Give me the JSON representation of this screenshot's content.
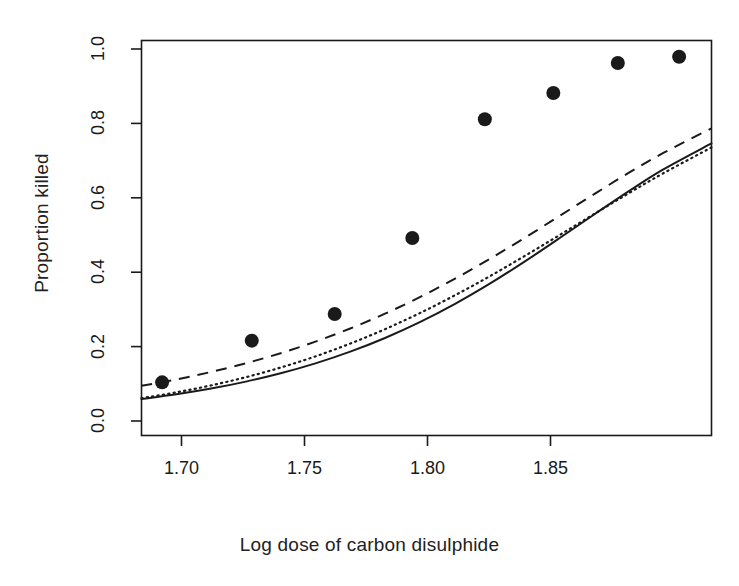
{
  "figure": {
    "title": "",
    "background_color": "#ffffff",
    "ink_color": "#1a1a1a"
  },
  "axes": {
    "x_label": "Log dose of carbon disulphide",
    "y_label": "Proportion killed",
    "x_ticks": [
      "1.70",
      "1.75",
      "1.80",
      "1.85"
    ],
    "y_ticks": [
      "0.0",
      "0.2",
      "0.4",
      "0.6",
      "0.8",
      "1.0"
    ]
  },
  "chart_data": {
    "type": "scatter",
    "title": "",
    "xlabel": "Log dose of carbon disulphide",
    "ylabel": "Proportion killed",
    "xlim": [
      1.683,
      1.896
    ],
    "ylim": [
      -0.045,
      1.045
    ],
    "xticks": [
      1.7,
      1.75,
      1.8,
      1.85
    ],
    "xticklabels": [
      "1.70",
      "1.75",
      "1.80",
      "1.85"
    ],
    "yticks": [
      0.0,
      0.2,
      0.4,
      0.6,
      0.8,
      1.0
    ],
    "yticklabels": [
      "0.0",
      "0.2",
      "0.4",
      "0.6",
      "0.8",
      "1.0"
    ],
    "grid": false,
    "legend": "none",
    "points": {
      "name": "Observed proportion killed",
      "marker": "filled-circle",
      "x": [
        1.6907,
        1.7242,
        1.7552,
        1.7842,
        1.8113,
        1.8369,
        1.861,
        1.8839
      ],
      "y": [
        0.1017,
        0.2167,
        0.2903,
        0.5,
        0.8276,
        0.9,
        0.9831,
        1.0
      ]
    },
    "series": [
      {
        "name": "logit fit",
        "linestyle": "solid",
        "x": [
          1.683,
          1.696,
          1.709,
          1.722,
          1.735,
          1.748,
          1.761,
          1.774,
          1.787,
          1.8,
          1.813,
          1.826,
          1.839,
          1.852,
          1.865,
          1.878,
          1.896
        ],
        "y": [
          0.0555,
          0.0686,
          0.0845,
          0.1037,
          0.1266,
          0.154,
          0.1863,
          0.2241,
          0.2678,
          0.3176,
          0.3733,
          0.4341,
          0.4985,
          0.5643,
          0.6288,
          0.6893,
          0.7611
        ]
      },
      {
        "name": "probit fit",
        "linestyle": "dotted",
        "x": [
          1.683,
          1.696,
          1.709,
          1.722,
          1.735,
          1.748,
          1.761,
          1.774,
          1.787,
          1.8,
          1.813,
          1.826,
          1.839,
          1.852,
          1.865,
          1.878,
          1.896
        ],
        "y": [
          0.058,
          0.074,
          0.0932,
          0.1159,
          0.1425,
          0.1733,
          0.2086,
          0.2484,
          0.2927,
          0.3414,
          0.3939,
          0.4495,
          0.5071,
          0.5655,
          0.6232,
          0.6787,
          0.75
        ]
      },
      {
        "name": "complementary log-log fit",
        "linestyle": "dashed",
        "x": [
          1.683,
          1.696,
          1.709,
          1.722,
          1.735,
          1.748,
          1.761,
          1.774,
          1.787,
          1.8,
          1.813,
          1.826,
          1.839,
          1.852,
          1.865,
          1.878,
          1.896
        ],
        "y": [
          0.092,
          0.1097,
          0.1304,
          0.1544,
          0.1822,
          0.214,
          0.2503,
          0.2912,
          0.3368,
          0.3871,
          0.4416,
          0.4996,
          0.5598,
          0.6204,
          0.6795,
          0.7346,
          0.8027
        ]
      }
    ],
    "note": "Three sigmoid link-function fits to beetle mortality data: solid = logit, dotted = probit, dashed = complementary log-log."
  }
}
